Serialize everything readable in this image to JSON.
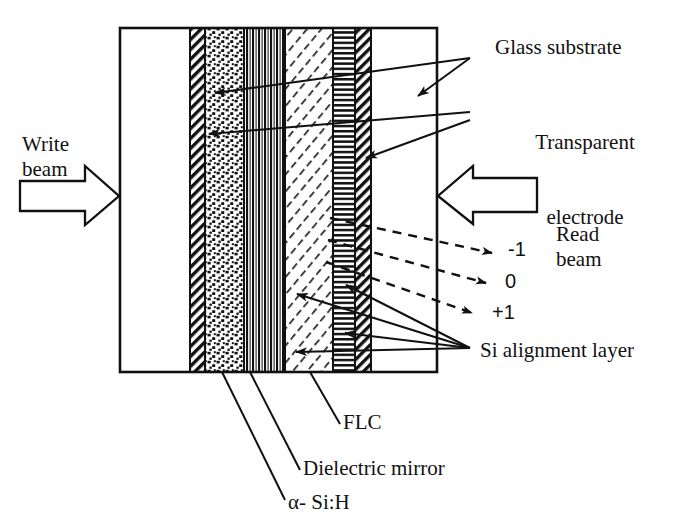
{
  "figure": {
    "type": "cross-section-diagram"
  },
  "beams": {
    "write": {
      "label": "Write\nbeam",
      "arrow": "block-arrow-right",
      "direction": "right"
    },
    "read": {
      "label": "Read\nbeam",
      "arrow": "block-arrow-left",
      "direction": "left"
    }
  },
  "orders": [
    {
      "label": "-1",
      "name": "minus-one-order"
    },
    {
      "label": "0",
      "name": "zero-order"
    },
    {
      "label": "+1",
      "name": "plus-one-order"
    }
  ],
  "callouts": {
    "glass_substrate": "Glass substrate",
    "transparent_electrode_line1": "Transparent",
    "transparent_electrode_line2": "electrode",
    "si_alignment_layer": "Si alignment layer",
    "flc": "FLC",
    "dielectric_mirror": "Dielectric mirror",
    "a_si_h": "α- Si:H"
  },
  "layers": [
    {
      "name": "glass-substrate-left",
      "pattern": "blank",
      "x": 120,
      "width": 70
    },
    {
      "name": "transparent-electrode-left",
      "pattern": "diagonal-hatch",
      "x": 190,
      "width": 15
    },
    {
      "name": "a-si-h-layer",
      "pattern": "dotted-speckle",
      "x": 205,
      "width": 39
    },
    {
      "name": "dielectric-mirror",
      "pattern": "vertical-stripes",
      "x": 244,
      "width": 41
    },
    {
      "name": "flc-layer",
      "pattern": "fine-diagonal-hatch",
      "x": 285,
      "width": 48
    },
    {
      "name": "si-alignment-layer",
      "pattern": "horizontal-stripes",
      "x": 333,
      "width": 22
    },
    {
      "name": "transparent-electrode-right",
      "pattern": "diagonal-hatch",
      "x": 355,
      "width": 16
    },
    {
      "name": "glass-substrate-right",
      "pattern": "blank",
      "x": 371,
      "width": 66
    }
  ],
  "frame": {
    "x": 120,
    "y": 28,
    "width": 317,
    "height": 344
  },
  "colors": {
    "ink": "#111111",
    "paper": "#ffffff"
  }
}
